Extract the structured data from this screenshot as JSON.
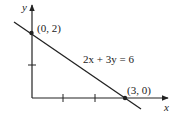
{
  "diagram": {
    "axes": {
      "x_label": "x",
      "y_label": "y"
    },
    "equation_label": "2x + 3y = 6",
    "points": [
      {
        "label": "(0, 2)",
        "x": 0,
        "y": 2
      },
      {
        "label": "(3, 0)",
        "x": 3,
        "y": 0
      }
    ],
    "x_ticks": [
      1,
      2
    ],
    "y_ticks": [
      1
    ],
    "colors": {
      "line": "#222222",
      "background": "#ffffff"
    }
  }
}
